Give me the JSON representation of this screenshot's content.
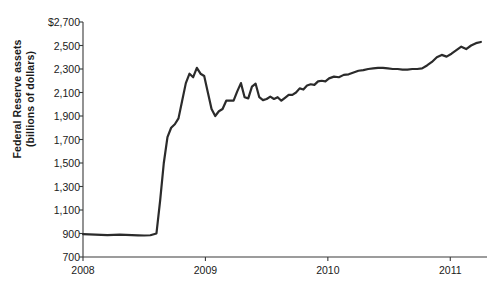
{
  "chart_data": {
    "type": "line",
    "title": "",
    "subtitle": "",
    "xlabel": "",
    "ylabel": "Federal Reserve assets (billions of dollars)",
    "ylabel_line1": "Federal Reserve assets",
    "ylabel_line2": "(billions of dollars)",
    "ylim": [
      700,
      2700
    ],
    "xlim": [
      2008.0,
      2011.3
    ],
    "ytick_labels": [
      "$2,700",
      "2,500",
      "2,300",
      "2,100",
      "1,900",
      "1,700",
      "1,500",
      "1,300",
      "1,100",
      "900",
      "700"
    ],
    "ytick_values": [
      2700,
      2500,
      2300,
      2100,
      1900,
      1700,
      1500,
      1300,
      1100,
      900,
      700
    ],
    "xtick_labels": [
      "2008",
      "2009",
      "2010",
      "2011"
    ],
    "xtick_values": [
      2008,
      2009,
      2010,
      2011
    ],
    "grid": false,
    "legend": "none",
    "line_color": "#2b2b2b",
    "line_width": 2.2,
    "series": [
      {
        "name": "Federal Reserve assets",
        "x": [
          2008.0,
          2008.05,
          2008.1,
          2008.15,
          2008.2,
          2008.25,
          2008.3,
          2008.35,
          2008.4,
          2008.45,
          2008.5,
          2008.55,
          2008.6,
          2008.63,
          2008.66,
          2008.69,
          2008.72,
          2008.75,
          2008.78,
          2008.81,
          2008.84,
          2008.87,
          2008.9,
          2008.93,
          2008.96,
          2008.99,
          2009.02,
          2009.05,
          2009.08,
          2009.11,
          2009.14,
          2009.17,
          2009.2,
          2009.23,
          2009.26,
          2009.29,
          2009.32,
          2009.35,
          2009.38,
          2009.41,
          2009.44,
          2009.47,
          2009.5,
          2009.53,
          2009.56,
          2009.59,
          2009.62,
          2009.65,
          2009.68,
          2009.71,
          2009.74,
          2009.77,
          2009.8,
          2009.83,
          2009.86,
          2009.89,
          2009.92,
          2009.95,
          2009.98,
          2010.01,
          2010.05,
          2010.09,
          2010.13,
          2010.17,
          2010.21,
          2010.25,
          2010.29,
          2010.33,
          2010.37,
          2010.41,
          2010.45,
          2010.49,
          2010.53,
          2010.57,
          2010.61,
          2010.65,
          2010.69,
          2010.73,
          2010.77,
          2010.81,
          2010.85,
          2010.89,
          2010.93,
          2010.97,
          2011.01,
          2011.05,
          2011.09,
          2011.13,
          2011.17,
          2011.21,
          2011.25
        ],
        "y": [
          895,
          893,
          890,
          888,
          887,
          889,
          890,
          888,
          886,
          884,
          883,
          885,
          900,
          1180,
          1500,
          1720,
          1800,
          1830,
          1880,
          2030,
          2180,
          2260,
          2230,
          2310,
          2260,
          2240,
          2100,
          1960,
          1900,
          1940,
          1960,
          2030,
          2030,
          2030,
          2110,
          2180,
          2060,
          2050,
          2150,
          2175,
          2060,
          2035,
          2045,
          2065,
          2045,
          2060,
          2030,
          2055,
          2080,
          2080,
          2100,
          2135,
          2125,
          2160,
          2170,
          2165,
          2195,
          2200,
          2195,
          2220,
          2235,
          2230,
          2250,
          2255,
          2270,
          2285,
          2290,
          2300,
          2305,
          2310,
          2310,
          2305,
          2300,
          2300,
          2295,
          2295,
          2300,
          2300,
          2305,
          2330,
          2360,
          2400,
          2420,
          2405,
          2430,
          2460,
          2490,
          2470,
          2500,
          2520,
          2530
        ]
      }
    ]
  }
}
